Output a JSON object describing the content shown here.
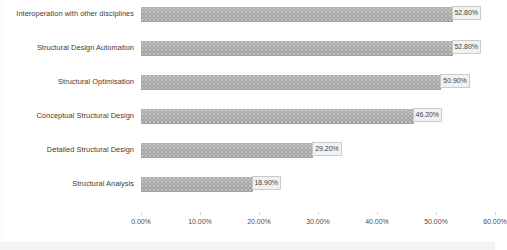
{
  "chart_data": {
    "type": "bar",
    "orientation": "horizontal",
    "title": "",
    "subtitle": "",
    "xlabel": "",
    "ylabel": "",
    "xlim": [
      0,
      60
    ],
    "grid": false,
    "legend": false,
    "legend_position": "none",
    "bar_color": "#a8a8a8",
    "data_label_format": "percent-2dp",
    "categories": [
      "Interoperation with other disciplines",
      "Structural Design Automation",
      "Structural Optimisation",
      "Conceptual Structural Design",
      "Detailed Structural Design",
      "Structural Analysis"
    ],
    "values": [
      52.8,
      52.8,
      50.9,
      46.2,
      29.2,
      18.9
    ],
    "data_labels": [
      "52.80%",
      "52.80%",
      "50.90%",
      "46.20%",
      "29.20%",
      "18.90%"
    ],
    "xticks": [
      0,
      10,
      20,
      30,
      40,
      50,
      60
    ],
    "xtick_labels": [
      "0.00%",
      "10.00%",
      "20.00%",
      "30.00%",
      "40.00%",
      "50.00%",
      "60.00%"
    ]
  }
}
